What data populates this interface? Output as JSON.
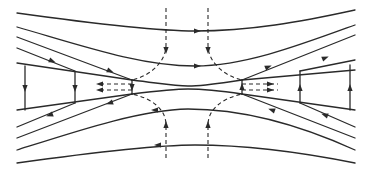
{
  "diagram": {
    "title": "",
    "colors": {
      "line": "#2a2a2a",
      "background": "#ffffff"
    },
    "solid_lines": [
      {
        "id": "top-outer",
        "d": "M17,13 C110,26 160,31 195,31 C250,31 300,22 355,10"
      },
      {
        "id": "top-second",
        "d": "M17,27 C80,45 140,66 195,66 C245,66 300,45 355,25"
      },
      {
        "id": "upper-left-diag-a",
        "d": "M17,37 L132,80"
      },
      {
        "id": "upper-left-diag-b",
        "d": "M17,48 L75,71"
      },
      {
        "id": "upper-right-diag-a",
        "d": "M242,80 L355,35"
      },
      {
        "id": "upper-right-diag-b",
        "d": "M300,71 L355,60"
      },
      {
        "id": "upper-left-boundary",
        "d": "M17,63 L132,80"
      },
      {
        "id": "upper-right-boundary",
        "d": "M242,80 L355,70"
      },
      {
        "id": "channel-upper",
        "d": "M132,80 C165,84 175,86 188,86 C205,86 215,84 242,80"
      },
      {
        "id": "channel-lower",
        "d": "M132,94 C165,90 175,89 188,89 C205,89 215,90 242,94"
      },
      {
        "id": "lower-left-boundary",
        "d": "M17,110 L132,94"
      },
      {
        "id": "lower-right-boundary",
        "d": "M242,94 L355,110"
      },
      {
        "id": "lower-left-diag-a",
        "d": "M17,138 L132,94"
      },
      {
        "id": "lower-left-diag-b",
        "d": "M17,127 L75,103"
      },
      {
        "id": "lower-right-diag-a",
        "d": "M242,94 L355,138"
      },
      {
        "id": "lower-right-diag-b",
        "d": "M300,103 L355,127"
      },
      {
        "id": "bottom-second",
        "d": "M17,150 C80,130 140,110 188,109 C245,109 300,125 355,150"
      },
      {
        "id": "bottom-outer",
        "d": "M17,163 C110,150 160,145 195,145 C250,145 300,152 355,163"
      },
      {
        "id": "left-vertical-outer",
        "d": "M25,66 L25,110"
      },
      {
        "id": "left-vertical-inner",
        "d": "M75,72 L75,103"
      },
      {
        "id": "right-vertical-inner",
        "d": "M300,71 L300,103"
      },
      {
        "id": "right-vertical-outer",
        "d": "M350,65 L350,110"
      },
      {
        "id": "left-xpoint-bar",
        "d": "M132,80 L132,94"
      },
      {
        "id": "right-xpoint-bar",
        "d": "M242,80 L242,94"
      }
    ],
    "dashed_lines": [
      {
        "id": "inflow-top-left",
        "d": "M166,8 L166,45 C166,62 150,76 132,80"
      },
      {
        "id": "inflow-top-right",
        "d": "M208,8 L208,45 C208,62 224,76 242,80"
      },
      {
        "id": "inflow-bottom-left",
        "d": "M166,158 L166,125 C166,108 150,98 132,94"
      },
      {
        "id": "inflow-bottom-right",
        "d": "M208,158 L208,125 C208,108 224,98 242,94"
      },
      {
        "id": "outflow-left-upper",
        "d": "M132,84 L98,84"
      },
      {
        "id": "outflow-left-lower",
        "d": "M132,90 L98,90"
      },
      {
        "id": "outflow-right-upper",
        "d": "M242,84 L278,84"
      },
      {
        "id": "outflow-right-lower",
        "d": "M242,90 L278,90"
      }
    ],
    "arrows": [
      {
        "id": "arrow-top-outer",
        "x": 197,
        "y": 31,
        "angle": 0
      },
      {
        "id": "arrow-top-second",
        "x": 197,
        "y": 66,
        "angle": 0
      },
      {
        "id": "arrow-upper-left-a",
        "x": 110,
        "y": 71,
        "angle": 22
      },
      {
        "id": "arrow-upper-left-b",
        "x": 52,
        "y": 61,
        "angle": 22
      },
      {
        "id": "arrow-upper-right-a",
        "x": 268,
        "y": 67,
        "angle": -22
      },
      {
        "id": "arrow-upper-right-b",
        "x": 325,
        "y": 58,
        "angle": -22
      },
      {
        "id": "arrow-lower-left-a",
        "x": 110,
        "y": 103,
        "angle": 160
      },
      {
        "id": "arrow-lower-left-b",
        "x": 50,
        "y": 115,
        "angle": 160
      },
      {
        "id": "arrow-lower-right-a",
        "x": 272,
        "y": 110,
        "angle": 200
      },
      {
        "id": "arrow-lower-right-b",
        "x": 325,
        "y": 115,
        "angle": 200
      },
      {
        "id": "arrow-bottom-second",
        "x": 155,
        "y": 110,
        "angle": 180
      },
      {
        "id": "arrow-bottom-outer",
        "x": 158,
        "y": 145,
        "angle": 180
      },
      {
        "id": "arrow-left-vertical-outer",
        "x": 25,
        "y": 88,
        "angle": 90
      },
      {
        "id": "arrow-left-vertical-inner",
        "x": 75,
        "y": 88,
        "angle": 90
      },
      {
        "id": "arrow-right-vertical-inner",
        "x": 300,
        "y": 88,
        "angle": -90
      },
      {
        "id": "arrow-right-vertical-outer",
        "x": 350,
        "y": 88,
        "angle": -90
      },
      {
        "id": "arrow-inflow-top-left",
        "x": 166,
        "y": 50,
        "angle": 90
      },
      {
        "id": "arrow-inflow-top-right",
        "x": 208,
        "y": 50,
        "angle": 90
      },
      {
        "id": "arrow-inflow-bottom-left",
        "x": 166,
        "y": 125,
        "angle": -90
      },
      {
        "id": "arrow-inflow-bottom-right",
        "x": 208,
        "y": 125,
        "angle": -90
      },
      {
        "id": "arrow-outflow-left-upper",
        "x": 100,
        "y": 84,
        "angle": 180
      },
      {
        "id": "arrow-outflow-left-lower",
        "x": 100,
        "y": 90,
        "angle": 180
      },
      {
        "id": "arrow-outflow-right-upper",
        "x": 270,
        "y": 84,
        "angle": 0
      },
      {
        "id": "arrow-outflow-right-lower",
        "x": 270,
        "y": 90,
        "angle": 0
      },
      {
        "id": "arrow-left-xpoint",
        "x": 132,
        "y": 87,
        "angle": 90
      },
      {
        "id": "arrow-right-xpoint",
        "x": 242,
        "y": 87,
        "angle": -90
      }
    ]
  }
}
